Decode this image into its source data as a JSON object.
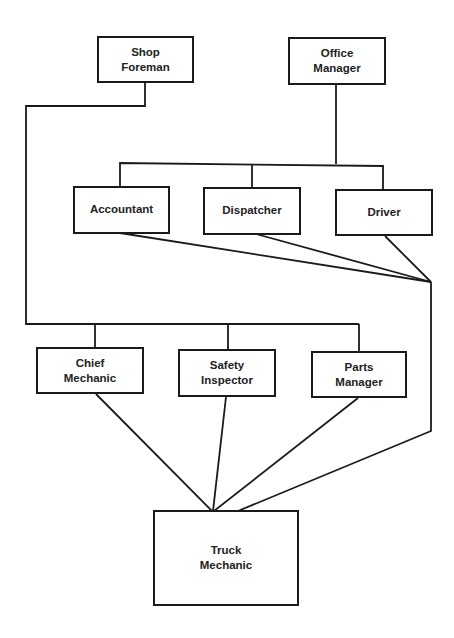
{
  "diagram": {
    "type": "organization-chart",
    "line_color": "#1a1a1a",
    "nodes": {
      "shop_foreman": {
        "line1": "Shop",
        "line2": "Foreman"
      },
      "office_manager": {
        "line1": "Office",
        "line2": "Manager"
      },
      "accountant": {
        "line1": "Accountant"
      },
      "dispatcher": {
        "line1": "Dispatcher"
      },
      "driver": {
        "line1": "Driver"
      },
      "chief_mechanic": {
        "line1": "Chief",
        "line2": "Mechanic"
      },
      "safety_inspector": {
        "line1": "Safety",
        "line2": "Inspector"
      },
      "parts_manager": {
        "line1": "Parts",
        "line2": "Manager"
      },
      "truck_mechanic": {
        "line1": "Truck",
        "line2": "Mechanic"
      }
    },
    "edges": [
      {
        "from": "Shop Foreman",
        "to": "Chief Mechanic"
      },
      {
        "from": "Shop Foreman",
        "to": "Safety Inspector"
      },
      {
        "from": "Shop Foreman",
        "to": "Parts Manager"
      },
      {
        "from": "Office Manager",
        "to": "Accountant"
      },
      {
        "from": "Office Manager",
        "to": "Dispatcher"
      },
      {
        "from": "Office Manager",
        "to": "Driver"
      },
      {
        "from": "Accountant",
        "to": "Truck Mechanic"
      },
      {
        "from": "Dispatcher",
        "to": "Truck Mechanic"
      },
      {
        "from": "Driver",
        "to": "Truck Mechanic"
      },
      {
        "from": "Chief Mechanic",
        "to": "Truck Mechanic"
      },
      {
        "from": "Safety Inspector",
        "to": "Truck Mechanic"
      },
      {
        "from": "Parts Manager",
        "to": "Truck Mechanic"
      }
    ]
  }
}
